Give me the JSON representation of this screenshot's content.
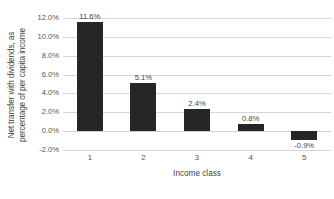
{
  "chart_data": {
    "type": "bar",
    "title": "",
    "subtitle": "",
    "categories": [
      "1",
      "2",
      "3",
      "4",
      "5"
    ],
    "values": [
      11.6,
      5.1,
      2.4,
      0.8,
      -0.9
    ],
    "data_labels": [
      "11.6%",
      "5.1%",
      "2.4%",
      "0.8%",
      "-0.9%"
    ],
    "xlabel": "Income class",
    "ylabel": "Net transfer with dividends, as percentage of per capita income",
    "ylabel_lines": [
      "Net transfer with dividends, as",
      "percentage of per capita income"
    ],
    "ylim": [
      -2.0,
      12.0
    ],
    "ytick_values": [
      12.0,
      10.0,
      8.0,
      6.0,
      4.0,
      2.0,
      0.0,
      -2.0
    ],
    "ytick_labels": [
      "12.0%",
      "10.0%",
      "8.0%",
      "6.0%",
      "4.0%",
      "2.0%",
      "0.0%",
      "-2.0%"
    ],
    "grid": true,
    "legend": false,
    "legend_position": "none",
    "series": [
      {
        "name": "Net transfer with dividends",
        "values": [
          11.6,
          5.1,
          2.4,
          0.8,
          -0.9
        ],
        "color": "#262626"
      }
    ],
    "colors": {
      "bar": "#262626",
      "gridline": "#d6d6d6",
      "text": "#3f3f3f",
      "tick_text": "#545454",
      "background": "#ffffff"
    }
  }
}
